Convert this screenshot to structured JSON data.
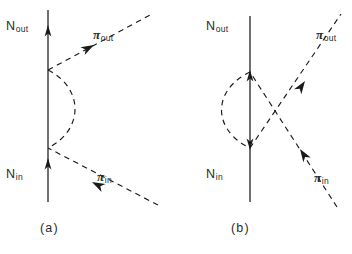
{
  "figure": {
    "type": "feynman-diagram-pair",
    "background_color": "#ffffff",
    "line_color": "#1a1a1a",
    "caption_a": "(a)",
    "caption_b": "(b)"
  },
  "diagram_a": {
    "panel_label": "(a)",
    "nucleon_in_label": "N",
    "nucleon_in_sub": "in",
    "nucleon_out_label": "N",
    "nucleon_out_sub": "out",
    "pion_in_label": "π",
    "pion_in_sub": "in",
    "pion_out_label": "π",
    "pion_out_sub": "out",
    "geometry": {
      "nucleon_line_x": 48,
      "nucleon_top_y": 10,
      "nucleon_bottom_y": 202,
      "vertex_upper_y": 70,
      "vertex_lower_y": 148,
      "arc_bulge_x": 86,
      "pion_out_end": [
        152,
        14
      ],
      "pion_in_start": [
        158,
        205
      ]
    }
  },
  "diagram_b": {
    "panel_label": "(b)",
    "nucleon_in_label": "N",
    "nucleon_in_sub": "in",
    "nucleon_out_label": "N",
    "nucleon_out_sub": "out",
    "pion_in_label": "π",
    "pion_in_sub": "in",
    "pion_out_label": "π",
    "pion_out_sub": "out",
    "geometry": {
      "nucleon_line_x": 250,
      "nucleon_top_y": 16,
      "nucleon_bottom_y": 202,
      "vertex_upper_y": 72,
      "vertex_lower_y": 148,
      "arc_bulge_x": 214,
      "pion_out_end": [
        341,
        14
      ],
      "pion_in_start": [
        337,
        207
      ]
    }
  }
}
